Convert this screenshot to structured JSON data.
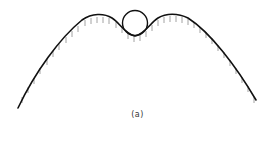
{
  "figure": {
    "caption": "(a)",
    "colors": {
      "curve": "#111111",
      "hatch": "#8a8a8a",
      "ball": "#111111",
      "background": "#ffffff"
    },
    "surface": {
      "path": "M18,108 C35,72 60,38 82,20 C92,13 104,13 112,18 C120,23 125,34 135,36 C145,34 150,23 158,18 C166,13 178,13 188,18 C210,32 236,66 256,100",
      "hatch_marks": [
        [
          22,
          96
        ],
        [
          28,
          86
        ],
        [
          34,
          77
        ],
        [
          40,
          67
        ],
        [
          47,
          58
        ],
        [
          53,
          50
        ],
        [
          59,
          43
        ],
        [
          66,
          36
        ],
        [
          72,
          30
        ],
        [
          78,
          25
        ],
        [
          85,
          19
        ],
        [
          91,
          17
        ],
        [
          97,
          16
        ],
        [
          103,
          16
        ],
        [
          109,
          17
        ],
        [
          116,
          21
        ],
        [
          122,
          26
        ],
        [
          128,
          32
        ],
        [
          134,
          35
        ],
        [
          140,
          34
        ],
        [
          146,
          30
        ],
        [
          152,
          24
        ],
        [
          158,
          19
        ],
        [
          164,
          16
        ],
        [
          170,
          15
        ],
        [
          176,
          15
        ],
        [
          182,
          16
        ],
        [
          188,
          18
        ],
        [
          194,
          21
        ],
        [
          200,
          26
        ],
        [
          206,
          31
        ],
        [
          212,
          37
        ],
        [
          218,
          44
        ],
        [
          224,
          51
        ],
        [
          230,
          59
        ],
        [
          236,
          67
        ],
        [
          242,
          76
        ],
        [
          248,
          85
        ],
        [
          254,
          96
        ]
      ],
      "hatch_length": 6
    },
    "ball": {
      "cx": 135,
      "cy": 23,
      "r": 12.5
    }
  }
}
